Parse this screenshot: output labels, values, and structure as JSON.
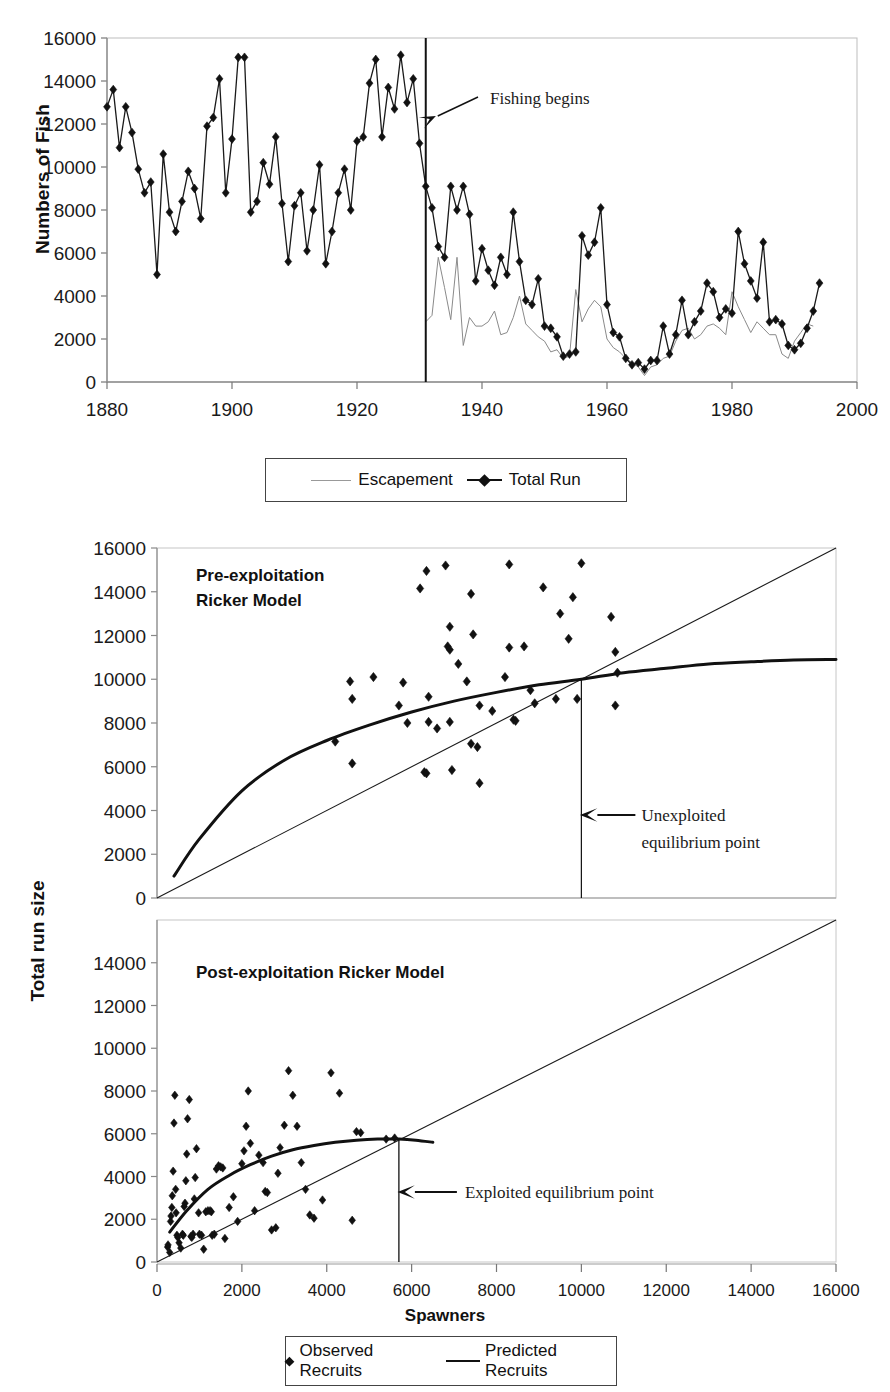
{
  "figure": {
    "clipped_top_title": "",
    "y_axis_label_top": "Numbers of Fish",
    "y_axis_label_bottom": "Total run size",
    "x_axis_label_bottom": "Spawners"
  },
  "legend_top": {
    "items": [
      {
        "label": "Escapement",
        "marker": "thin-line"
      },
      {
        "label": "Total Run",
        "marker": "line-with-diamond"
      }
    ]
  },
  "legend_bottom": {
    "items": [
      {
        "label": "Observed Recruits",
        "marker": "diamond"
      },
      {
        "label": "Predicted Recruits",
        "marker": "thick-line"
      }
    ]
  },
  "chart_data": [
    {
      "id": "timeseries",
      "type": "line",
      "title": "",
      "xlabel": "",
      "ylabel": "Numbers of Fish",
      "xlim": [
        1880,
        2000
      ],
      "ylim": [
        0,
        16000
      ],
      "xticks": [
        1880,
        1900,
        1920,
        1940,
        1960,
        1980,
        2000
      ],
      "yticks": [
        0,
        2000,
        4000,
        6000,
        8000,
        10000,
        12000,
        14000,
        16000
      ],
      "grid": false,
      "annotations": [
        {
          "text": "Fishing begins",
          "x": 1931,
          "y": 14000,
          "type": "arrow-vline"
        }
      ],
      "vline": {
        "x": 1931,
        "label": "Fishing begins"
      },
      "series": [
        {
          "name": "Total Run",
          "marker": "diamond",
          "x": [
            1880,
            1881,
            1882,
            1883,
            1884,
            1885,
            1886,
            1887,
            1888,
            1889,
            1890,
            1891,
            1892,
            1893,
            1894,
            1895,
            1896,
            1897,
            1898,
            1899,
            1900,
            1901,
            1902,
            1903,
            1904,
            1905,
            1906,
            1907,
            1908,
            1909,
            1910,
            1911,
            1912,
            1913,
            1914,
            1915,
            1916,
            1917,
            1918,
            1919,
            1920,
            1921,
            1922,
            1923,
            1924,
            1925,
            1926,
            1927,
            1928,
            1929,
            1930,
            1931,
            1932,
            1933,
            1934,
            1935,
            1936,
            1937,
            1938,
            1939,
            1940,
            1941,
            1942,
            1943,
            1944,
            1945,
            1946,
            1947,
            1948,
            1949,
            1950,
            1951,
            1952,
            1953,
            1954,
            1955,
            1956,
            1957,
            1958,
            1959,
            1960,
            1961,
            1962,
            1963,
            1964,
            1965,
            1966,
            1967,
            1968,
            1969,
            1970,
            1971,
            1972,
            1973,
            1974,
            1975,
            1976,
            1977,
            1978,
            1979,
            1980,
            1981,
            1982,
            1983,
            1984,
            1985,
            1986,
            1987,
            1988,
            1989,
            1990,
            1991,
            1992,
            1993,
            1994,
            1995,
            1996,
            1997,
            1998,
            1999,
            2000
          ],
          "values": [
            12800,
            13600,
            10900,
            12800,
            11600,
            9900,
            8800,
            9300,
            5000,
            10600,
            7900,
            7000,
            8400,
            9800,
            9000,
            7600,
            11900,
            12300,
            14100,
            8800,
            11300,
            15100,
            15100,
            7900,
            8400,
            10200,
            9200,
            11400,
            8300,
            5600,
            8200,
            8800,
            6100,
            8000,
            10100,
            5500,
            7000,
            8800,
            9900,
            8000,
            11200,
            11400,
            13900,
            15000,
            11400,
            13700,
            12700,
            15200,
            13000,
            14100,
            11100,
            9100,
            8100,
            6300,
            5800,
            9100,
            8000,
            9100,
            7800,
            4700,
            6200,
            5200,
            4500,
            5800,
            5000,
            7900,
            5600,
            3800,
            3600,
            4800,
            2600,
            2500,
            2100,
            1200,
            1300,
            1400,
            6800,
            5900,
            6500,
            8100,
            3600,
            2300,
            2100,
            1100,
            800,
            900,
            600,
            1000,
            1000,
            2600,
            1300,
            2200,
            3800,
            2200,
            2800,
            3300,
            4600,
            4200,
            3000,
            3400,
            3200,
            7000,
            5500,
            4700,
            3900,
            6500,
            2800,
            2900,
            2700,
            1700,
            1500,
            1800,
            2500,
            3300,
            4600
          ]
        },
        {
          "name": "Escapement",
          "marker": "thin-line",
          "x": [
            1931,
            1932,
            1933,
            1934,
            1935,
            1936,
            1937,
            1938,
            1939,
            1940,
            1941,
            1942,
            1943,
            1944,
            1945,
            1946,
            1947,
            1948,
            1949,
            1950,
            1951,
            1952,
            1953,
            1954,
            1955,
            1956,
            1957,
            1958,
            1959,
            1960,
            1961,
            1962,
            1963,
            1964,
            1965,
            1966,
            1967,
            1968,
            1969,
            1970,
            1971,
            1972,
            1973,
            1974,
            1975,
            1976,
            1977,
            1978,
            1979,
            1980,
            1981,
            1982,
            1983,
            1984,
            1985,
            1986,
            1987,
            1988,
            1989,
            1990,
            1991,
            1992,
            1993,
            1994,
            1995,
            1996,
            1997,
            1998,
            1999,
            2000
          ],
          "values": [
            2800,
            3100,
            5800,
            4400,
            2900,
            5800,
            1700,
            3000,
            2600,
            2600,
            2800,
            3300,
            2200,
            2300,
            3000,
            4000,
            2700,
            2400,
            2100,
            1900,
            1400,
            1500,
            1100,
            1200,
            4300,
            2800,
            3400,
            3800,
            3500,
            2000,
            1600,
            1400,
            1100,
            900,
            700,
            300,
            700,
            800,
            1100,
            1200,
            1900,
            2400,
            2500,
            2000,
            2200,
            2600,
            2700,
            2500,
            2200,
            4200,
            3500,
            2900,
            2300,
            2800,
            2500,
            2200,
            2200,
            1300,
            1100,
            1900,
            2300,
            2700,
            2600
          ]
        }
      ]
    },
    {
      "id": "pre-exploitation-ricker",
      "type": "scatter",
      "title": "Pre-exploitation\nRicker Model",
      "title_lines": [
        "Pre-exploitation",
        "Ricker Model"
      ],
      "xlabel": "Spawners",
      "ylabel": "Total run size",
      "xlim": [
        0,
        16000
      ],
      "ylim": [
        0,
        16000
      ],
      "yticks": [
        0,
        2000,
        4000,
        6000,
        8000,
        10000,
        12000,
        14000,
        16000
      ],
      "grid": false,
      "annotations": [
        {
          "text": "Unexploited equilibrium point",
          "x": 10000,
          "y": 10000,
          "lines": [
            "Unexploited",
            "equilibrium point"
          ],
          "type": "arrow-left"
        }
      ],
      "equilibrium_point": {
        "spawners": 10000,
        "recruits": 10000
      },
      "reference_line": {
        "name": "1:1 replacement",
        "from": [
          0,
          0
        ],
        "to": [
          16000,
          16000
        ]
      },
      "ricker_curve": {
        "name": "Predicted Recruits",
        "x": [
          400,
          1000,
          2000,
          3000,
          4000,
          5000,
          6000,
          7000,
          8000,
          9000,
          10000,
          11000,
          12000,
          13000,
          14000,
          15000,
          16000
        ],
        "values": [
          1000,
          2700,
          4900,
          6300,
          7200,
          7900,
          8500,
          9000,
          9400,
          9750,
          10000,
          10300,
          10500,
          10700,
          10800,
          10880,
          10900
        ]
      },
      "points": [
        {
          "x": 4200,
          "y": 7150
        },
        {
          "x": 4600,
          "y": 6150
        },
        {
          "x": 4550,
          "y": 9900
        },
        {
          "x": 4600,
          "y": 9100
        },
        {
          "x": 5100,
          "y": 10100
        },
        {
          "x": 5800,
          "y": 9850
        },
        {
          "x": 5700,
          "y": 8800
        },
        {
          "x": 5900,
          "y": 8000
        },
        {
          "x": 6400,
          "y": 9200
        },
        {
          "x": 6300,
          "y": 5750
        },
        {
          "x": 6350,
          "y": 5700
        },
        {
          "x": 6400,
          "y": 8050
        },
        {
          "x": 6600,
          "y": 7750
        },
        {
          "x": 6350,
          "y": 14950
        },
        {
          "x": 6200,
          "y": 14150
        },
        {
          "x": 6900,
          "y": 8050
        },
        {
          "x": 6950,
          "y": 5850
        },
        {
          "x": 6900,
          "y": 12400
        },
        {
          "x": 6850,
          "y": 11500
        },
        {
          "x": 6900,
          "y": 11350
        },
        {
          "x": 6800,
          "y": 15200
        },
        {
          "x": 7100,
          "y": 10700
        },
        {
          "x": 7300,
          "y": 9900
        },
        {
          "x": 7400,
          "y": 13900
        },
        {
          "x": 7450,
          "y": 12050
        },
        {
          "x": 7400,
          "y": 7050
        },
        {
          "x": 7550,
          "y": 6900
        },
        {
          "x": 7600,
          "y": 8800
        },
        {
          "x": 7600,
          "y": 5250
        },
        {
          "x": 7900,
          "y": 8550
        },
        {
          "x": 8300,
          "y": 11450
        },
        {
          "x": 8200,
          "y": 10100
        },
        {
          "x": 8400,
          "y": 8150
        },
        {
          "x": 8450,
          "y": 8100
        },
        {
          "x": 8300,
          "y": 15250
        },
        {
          "x": 8800,
          "y": 9500
        },
        {
          "x": 8650,
          "y": 11500
        },
        {
          "x": 8900,
          "y": 8900
        },
        {
          "x": 9100,
          "y": 14200
        },
        {
          "x": 9400,
          "y": 9100
        },
        {
          "x": 9500,
          "y": 13000
        },
        {
          "x": 9700,
          "y": 11850
        },
        {
          "x": 9800,
          "y": 13750
        },
        {
          "x": 9900,
          "y": 9100
        },
        {
          "x": 10000,
          "y": 15300
        },
        {
          "x": 10700,
          "y": 12850
        },
        {
          "x": 10800,
          "y": 11250
        },
        {
          "x": 10850,
          "y": 10300
        },
        {
          "x": 10800,
          "y": 8800
        }
      ]
    },
    {
      "id": "post-exploitation-ricker",
      "type": "scatter",
      "title": "Post-exploitation Ricker Model",
      "title_lines": [
        "Post-exploitation Ricker Model"
      ],
      "xlabel": "Spawners",
      "ylabel": "Total run size",
      "xlim": [
        0,
        16000
      ],
      "ylim": [
        0,
        16000
      ],
      "xticks": [
        0,
        2000,
        4000,
        6000,
        8000,
        10000,
        12000,
        14000,
        16000
      ],
      "yticks": [
        0,
        2000,
        4000,
        6000,
        8000,
        10000,
        12000,
        14000
      ],
      "grid": false,
      "annotations": [
        {
          "text": "Exploited equilibrium point",
          "x": 5700,
          "y": 5700,
          "lines": [
            "Exploited equilibrium point"
          ],
          "type": "arrow-left"
        }
      ],
      "equilibrium_point": {
        "spawners": 5700,
        "recruits": 5700
      },
      "reference_line": {
        "name": "1:1 replacement",
        "from": [
          0,
          0
        ],
        "to": [
          16000,
          16000
        ]
      },
      "ricker_curve": {
        "name": "Predicted Recruits",
        "x": [
          300,
          700,
          1200,
          1700,
          2200,
          2700,
          3200,
          3700,
          4200,
          4700,
          5200,
          5700,
          6100,
          6500
        ],
        "values": [
          1400,
          2400,
          3400,
          4050,
          4550,
          4950,
          5250,
          5450,
          5600,
          5700,
          5750,
          5750,
          5700,
          5600
        ]
      },
      "points": [
        {
          "x": 250,
          "y": 700
        },
        {
          "x": 260,
          "y": 800
        },
        {
          "x": 300,
          "y": 450
        },
        {
          "x": 320,
          "y": 1900
        },
        {
          "x": 330,
          "y": 2150
        },
        {
          "x": 350,
          "y": 2550
        },
        {
          "x": 360,
          "y": 3100
        },
        {
          "x": 380,
          "y": 4250
        },
        {
          "x": 400,
          "y": 6500
        },
        {
          "x": 420,
          "y": 7800
        },
        {
          "x": 440,
          "y": 3400
        },
        {
          "x": 450,
          "y": 2300
        },
        {
          "x": 470,
          "y": 1250
        },
        {
          "x": 490,
          "y": 1150
        },
        {
          "x": 520,
          "y": 900
        },
        {
          "x": 560,
          "y": 650
        },
        {
          "x": 600,
          "y": 1300
        },
        {
          "x": 620,
          "y": 1250
        },
        {
          "x": 640,
          "y": 2600
        },
        {
          "x": 660,
          "y": 2750
        },
        {
          "x": 680,
          "y": 3800
        },
        {
          "x": 700,
          "y": 5050
        },
        {
          "x": 720,
          "y": 6700
        },
        {
          "x": 760,
          "y": 7600
        },
        {
          "x": 800,
          "y": 1200
        },
        {
          "x": 820,
          "y": 1150
        },
        {
          "x": 850,
          "y": 1300
        },
        {
          "x": 880,
          "y": 2950
        },
        {
          "x": 900,
          "y": 3950
        },
        {
          "x": 930,
          "y": 5300
        },
        {
          "x": 980,
          "y": 2300
        },
        {
          "x": 1000,
          "y": 1300
        },
        {
          "x": 1050,
          "y": 1250
        },
        {
          "x": 1100,
          "y": 600
        },
        {
          "x": 1150,
          "y": 2350
        },
        {
          "x": 1200,
          "y": 2400
        },
        {
          "x": 1250,
          "y": 2400
        },
        {
          "x": 1280,
          "y": 2350
        },
        {
          "x": 1300,
          "y": 1250
        },
        {
          "x": 1350,
          "y": 1300
        },
        {
          "x": 1400,
          "y": 4350
        },
        {
          "x": 1450,
          "y": 4500
        },
        {
          "x": 1500,
          "y": 4450
        },
        {
          "x": 1550,
          "y": 4400
        },
        {
          "x": 1600,
          "y": 1100
        },
        {
          "x": 1700,
          "y": 2550
        },
        {
          "x": 1800,
          "y": 3050
        },
        {
          "x": 1900,
          "y": 1900
        },
        {
          "x": 2000,
          "y": 4600
        },
        {
          "x": 2050,
          "y": 5200
        },
        {
          "x": 2100,
          "y": 6350
        },
        {
          "x": 2150,
          "y": 8000
        },
        {
          "x": 2200,
          "y": 5550
        },
        {
          "x": 2300,
          "y": 2400
        },
        {
          "x": 2400,
          "y": 5000
        },
        {
          "x": 2500,
          "y": 4650
        },
        {
          "x": 2550,
          "y": 3300
        },
        {
          "x": 2600,
          "y": 3250
        },
        {
          "x": 2700,
          "y": 1500
        },
        {
          "x": 2800,
          "y": 1600
        },
        {
          "x": 2850,
          "y": 4150
        },
        {
          "x": 2900,
          "y": 5350
        },
        {
          "x": 3000,
          "y": 6400
        },
        {
          "x": 3100,
          "y": 8950
        },
        {
          "x": 3200,
          "y": 7800
        },
        {
          "x": 3300,
          "y": 6350
        },
        {
          "x": 3400,
          "y": 4650
        },
        {
          "x": 3500,
          "y": 3400
        },
        {
          "x": 3600,
          "y": 2200
        },
        {
          "x": 3700,
          "y": 2050
        },
        {
          "x": 3900,
          "y": 2900
        },
        {
          "x": 4100,
          "y": 8850
        },
        {
          "x": 4300,
          "y": 7900
        },
        {
          "x": 4600,
          "y": 1950
        },
        {
          "x": 4700,
          "y": 6100
        },
        {
          "x": 4800,
          "y": 6050
        },
        {
          "x": 5400,
          "y": 5750
        },
        {
          "x": 5600,
          "y": 5800
        }
      ]
    }
  ]
}
